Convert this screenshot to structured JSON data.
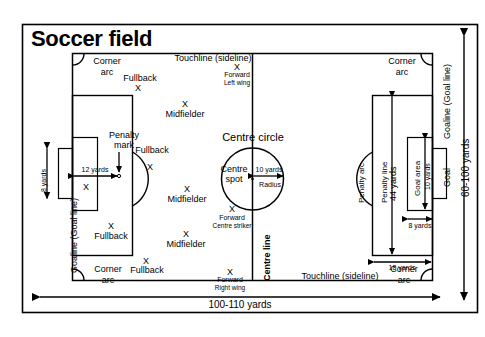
{
  "title": "Soccer field",
  "colors": {
    "line": "#000000",
    "background": "#ffffff",
    "frame": "#000000"
  },
  "field": {
    "goalline_left_label": "Goaline (Goal line)",
    "goalline_right_label": "Goaline (Goal line)",
    "touchline_top_label": "Touchline (sideline)",
    "touchline_bottom_label": "Touchline (sideline)",
    "centre_line_label": "Centre line",
    "centre_circle_label": "Centre circle",
    "centre_spot_label_1": "Centre",
    "centre_spot_label_2": "spot",
    "penalty_mark_label_1": "Penalty",
    "penalty_mark_label_2": "mark",
    "penalty_arc_label": "Penalty arc",
    "penalty_line_label": "Penalty line",
    "goal_area_label": "Goal area",
    "goal_label": "Goal",
    "corner_arc_label_1": "Corner",
    "corner_arc_label_2": "arc"
  },
  "dimensions": {
    "length": "100-110 yards",
    "width": "60-100 yards",
    "penalty_spot_distance": "12 yards",
    "goal_width": "8 yards",
    "goal_area_depth": "8 yards",
    "goal_area_width": "10 yards",
    "penalty_area_width": "44 yards",
    "penalty_area_depth": "18 yards",
    "centre_circle_radius": "10 yards",
    "radius_label": "Radius"
  },
  "corners": [
    {
      "name": "top-left",
      "label1": "Corner",
      "label2": "arc"
    },
    {
      "name": "top-right",
      "label1": "Corner",
      "label2": "arc"
    },
    {
      "name": "bottom-left",
      "label1": "Corner",
      "label2": "arc"
    },
    {
      "name": "bottom-right",
      "label1": "Corner",
      "label2": "arc"
    }
  ],
  "players": [
    {
      "mark": "X",
      "role": "Fullback",
      "sub": "",
      "x": 138,
      "y": 84,
      "lx": 140,
      "ly": 74
    },
    {
      "mark": "X",
      "role": "Midfielder",
      "sub": "",
      "x": 185,
      "y": 100,
      "lx": 185,
      "ly": 110
    },
    {
      "mark": "X",
      "role": "Forward",
      "sub": "Left wing",
      "x": 237,
      "y": 63,
      "lx": 237,
      "ly": 71
    },
    {
      "mark": "X",
      "role": "Fullback",
      "sub": "",
      "x": 150,
      "y": 163,
      "lx": 152,
      "ly": 146
    },
    {
      "mark": "X",
      "role": "Midfielder",
      "sub": "",
      "x": 187,
      "y": 185,
      "lx": 187,
      "ly": 195
    },
    {
      "mark": "X",
      "role": "Forward",
      "sub": "Centre striker",
      "x": 232,
      "y": 205,
      "lx": 232,
      "ly": 214
    },
    {
      "mark": "X",
      "role": "Midfielder",
      "sub": "",
      "x": 186,
      "y": 230,
      "lx": 186,
      "ly": 240
    },
    {
      "mark": "X",
      "role": "Fullback",
      "sub": "",
      "x": 146,
      "y": 257,
      "lx": 147,
      "ly": 266
    },
    {
      "mark": "X",
      "role": "Forward",
      "sub": "Right wing",
      "x": 230,
      "y": 268,
      "lx": 230,
      "ly": 276
    },
    {
      "mark": "X",
      "role": "Fullback",
      "sub": "",
      "x": 111,
      "y": 222,
      "lx": 111,
      "ly": 232
    },
    {
      "mark": "X",
      "role": "",
      "sub": "",
      "x": 86,
      "y": 183,
      "lx": 0,
      "ly": 0
    }
  ],
  "chart_data": {
    "type": "diagram",
    "title": "Soccer field"
  }
}
